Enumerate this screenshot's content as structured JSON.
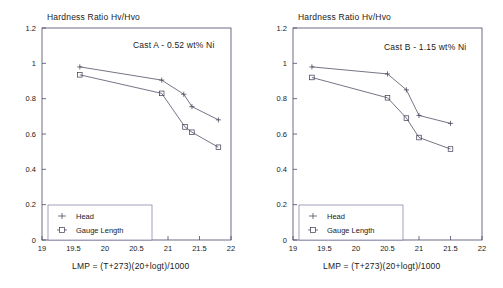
{
  "figure": {
    "background": "#ffffff",
    "panels": [
      {
        "id": "panel-a",
        "ylabel": "Hardness Ratio Hv/Hvo",
        "xlabel": "LMP = (T+273)(20+logt)/1000",
        "annotation": "Cast A - 0.52 wt% Ni",
        "legend": {
          "items": [
            {
              "label": "Head",
              "marker": "plus"
            },
            {
              "label": "Gauge Length",
              "marker": "square"
            }
          ]
        }
      },
      {
        "id": "panel-b",
        "ylabel": "Hardness Ratio Hv/Hvo",
        "xlabel": "LMP = (T+273)(20+logt)/1000",
        "annotation": "Cast B - 1.15 wt% Ni",
        "legend": {
          "items": [
            {
              "label": "Head",
              "marker": "plus"
            },
            {
              "label": "Gauge Length",
              "marker": "square"
            }
          ]
        }
      }
    ]
  },
  "chart_data": [
    {
      "type": "line",
      "title": "Cast A - 0.52 wt% Ni",
      "xlabel": "LMP = (T+273)(20+logt)/1000",
      "ylabel": "Hardness Ratio Hv/Hvo",
      "xlim": [
        19,
        22
      ],
      "ylim": [
        0,
        1.2
      ],
      "xticks": [
        19,
        19.5,
        20,
        20.5,
        21,
        21.5,
        22
      ],
      "xticklabels": [
        "19",
        "19.5",
        "20",
        "20.5",
        "21",
        "21.5",
        "22"
      ],
      "yticks": [
        0,
        0.2,
        0.4,
        0.6,
        0.8,
        1,
        1.2
      ],
      "yticklabels": [
        "0",
        "0.2",
        "0.4",
        "0.6",
        "0.8",
        "1",
        "1.2"
      ],
      "grid": false,
      "legend_position": "lower left",
      "series": [
        {
          "name": "Head",
          "marker": "plus",
          "x": [
            19.6,
            20.9,
            21.25,
            21.38,
            21.8
          ],
          "values": [
            0.98,
            0.905,
            0.825,
            0.755,
            0.68
          ]
        },
        {
          "name": "Gauge Length",
          "marker": "square",
          "x": [
            19.6,
            20.9,
            21.27,
            21.38,
            21.8
          ],
          "values": [
            0.935,
            0.83,
            0.64,
            0.61,
            0.525
          ]
        }
      ]
    },
    {
      "type": "line",
      "title": "Cast B - 1.15 wt% Ni",
      "xlabel": "LMP = (T+273)(20+logt)/1000",
      "ylabel": "Hardness Ratio Hv/Hvo",
      "xlim": [
        19,
        22
      ],
      "ylim": [
        0,
        1.2
      ],
      "xticks": [
        19,
        19.5,
        20,
        20.5,
        21,
        21.5,
        22
      ],
      "xticklabels": [
        "19",
        "19.5",
        "20",
        "20.5",
        "21",
        "21.5",
        "22"
      ],
      "yticks": [
        0,
        0.2,
        0.4,
        0.6,
        0.8,
        1,
        1.2
      ],
      "yticklabels": [
        "0",
        "0.2",
        "0.4",
        "0.6",
        "0.8",
        "1",
        "1.2"
      ],
      "grid": false,
      "legend_position": "lower left",
      "series": [
        {
          "name": "Head",
          "marker": "plus",
          "x": [
            19.3,
            20.5,
            20.8,
            21.0,
            21.5
          ],
          "values": [
            0.98,
            0.94,
            0.85,
            0.705,
            0.66
          ]
        },
        {
          "name": "Gauge Length",
          "marker": "square",
          "x": [
            19.3,
            20.5,
            20.8,
            21.0,
            21.5
          ],
          "values": [
            0.92,
            0.805,
            0.69,
            0.58,
            0.515
          ]
        }
      ]
    }
  ],
  "colors": {
    "axis": "#4a4a6a",
    "line": "#3a3a52",
    "text": "#1a1a1a",
    "legend_border": "#7a7aa0",
    "background": "#ffffff"
  }
}
